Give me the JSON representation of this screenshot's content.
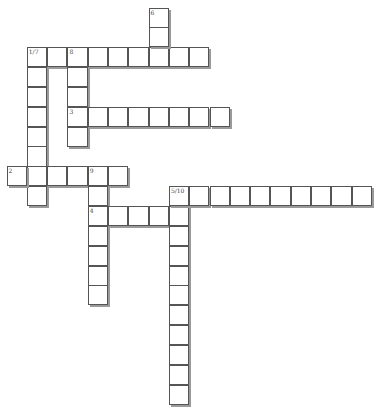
{
  "puzzle": {
    "type": "crossword",
    "cell_size": 20.3,
    "origin": {
      "x": 6.5,
      "y": 7.5
    },
    "words": [
      {
        "number": "1",
        "direction": "across",
        "row": 2,
        "col": 1,
        "length": 9
      },
      {
        "number": "7",
        "direction": "down",
        "row": 2,
        "col": 1,
        "length": 8
      },
      {
        "number": "8",
        "direction": "down",
        "row": 2,
        "col": 3,
        "length": 5
      },
      {
        "number": "6",
        "direction": "down",
        "row": 0,
        "col": 7,
        "length": 3
      },
      {
        "number": "3",
        "direction": "across",
        "row": 5,
        "col": 3,
        "length": 8
      },
      {
        "number": "2",
        "direction": "across",
        "row": 8,
        "col": 0,
        "length": 6
      },
      {
        "number": "9",
        "direction": "down",
        "row": 8,
        "col": 4,
        "length": 7
      },
      {
        "number": "4",
        "direction": "across",
        "row": 10,
        "col": 4,
        "length": 5
      },
      {
        "number": "5",
        "direction": "across",
        "row": 9,
        "col": 8,
        "length": 10
      },
      {
        "number": "10",
        "direction": "down",
        "row": 9,
        "col": 8,
        "length": 11
      }
    ],
    "labels": [
      {
        "row": 0,
        "col": 7,
        "text": "6"
      },
      {
        "row": 2,
        "col": 1,
        "text": "1/7"
      },
      {
        "row": 2,
        "col": 3,
        "text": "8"
      },
      {
        "row": 5,
        "col": 3,
        "text": "3"
      },
      {
        "row": 8,
        "col": 0,
        "text": "2"
      },
      {
        "row": 8,
        "col": 4,
        "text": "9"
      },
      {
        "row": 9,
        "col": 8,
        "text": "5/10"
      },
      {
        "row": 10,
        "col": 4,
        "text": "4"
      }
    ]
  }
}
